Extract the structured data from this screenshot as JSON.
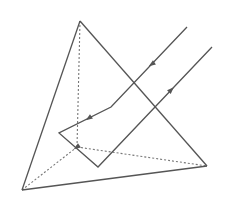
{
  "diagram": {
    "title": "",
    "colors": {
      "edge": "#555555",
      "hidden_edge": "#777777",
      "ray": "#555555",
      "background": "#ffffff"
    },
    "vertices": {
      "apex": [
        80,
        21
      ],
      "left": [
        22,
        190
      ],
      "right": [
        207,
        166
      ],
      "back": [
        77,
        147
      ]
    },
    "visible_edges": [
      {
        "from": "apex",
        "to": "left"
      },
      {
        "from": "apex",
        "to": "right"
      },
      {
        "from": "left",
        "to": "right"
      }
    ],
    "hidden_edges": [
      {
        "from": "apex",
        "to": "back"
      },
      {
        "from": "left",
        "to": "back"
      },
      {
        "from": "back",
        "to": "right"
      }
    ],
    "ray_path": [
      [
        187,
        27
      ],
      [
        111,
        107
      ],
      [
        59,
        133
      ],
      [
        98,
        167
      ],
      [
        212,
        47
      ]
    ],
    "arrows": [
      {
        "at": [
          152,
          64
        ],
        "direction": "down-left"
      },
      {
        "at": [
          89,
          118
        ],
        "direction": "down-left"
      },
      {
        "at": [
          77,
          147
        ],
        "direction": "down-left"
      },
      {
        "at": [
          171,
          90
        ],
        "direction": "up-right"
      }
    ]
  }
}
